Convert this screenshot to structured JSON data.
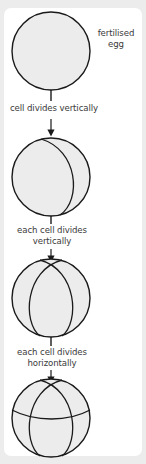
{
  "diagram": {
    "colors": {
      "background": "#ececec",
      "card": "#ffffff",
      "cell_fill": "#ececec",
      "stroke": "#1a1a1a",
      "text": "#3a3a3a"
    },
    "stages": [
      {
        "id": "stage-1",
        "side_label_line1": "fertilised",
        "side_label_line2": "egg",
        "cells": 1
      },
      {
        "id": "stage-2",
        "cells": 2
      },
      {
        "id": "stage-3",
        "cells": 4
      },
      {
        "id": "stage-4",
        "cells": 8
      }
    ],
    "steps": [
      {
        "line1": "cell divides vertically"
      },
      {
        "line1": "each cell divides",
        "line2": "vertically"
      },
      {
        "line1": "each cell divides",
        "line2": "horizontally"
      }
    ]
  }
}
